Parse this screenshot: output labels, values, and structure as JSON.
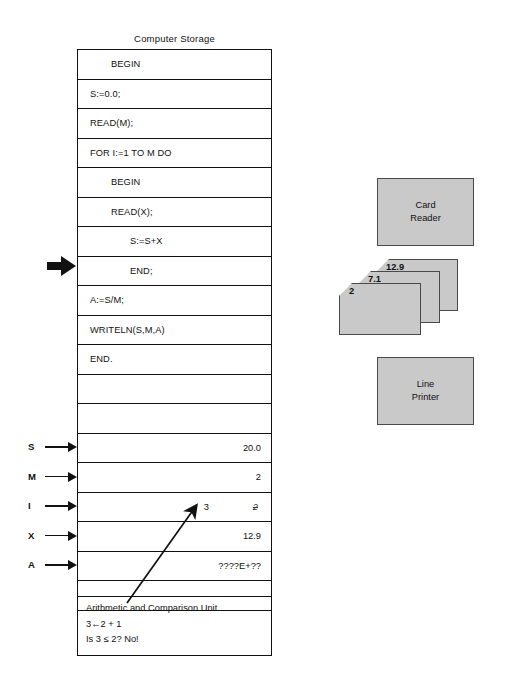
{
  "storage": {
    "title": "Computer Storage",
    "rows": [
      {
        "code": "BEGIN",
        "indent": 1,
        "value": ""
      },
      {
        "code": "S:=0.0;",
        "indent": 0,
        "value": ""
      },
      {
        "code": "READ(M);",
        "indent": 0,
        "value": ""
      },
      {
        "code": "FOR I:=1 TO M DO",
        "indent": 0,
        "value": ""
      },
      {
        "code": "BEGIN",
        "indent": 1,
        "value": ""
      },
      {
        "code": "READ(X);",
        "indent": 1,
        "value": ""
      },
      {
        "code": "S:=S+X",
        "indent": 2,
        "value": ""
      },
      {
        "code": "END;",
        "indent": 2,
        "value": ""
      },
      {
        "code": "A:=S/M;",
        "indent": 0,
        "value": ""
      },
      {
        "code": "WRITELN(S,M,A)",
        "indent": 0,
        "value": ""
      },
      {
        "code": "END.",
        "indent": 0,
        "value": ""
      },
      {
        "code": "",
        "indent": 0,
        "value": ""
      },
      {
        "code": "",
        "indent": 0,
        "value": ""
      },
      {
        "code": "",
        "indent": 0,
        "value": "20.0"
      },
      {
        "code": "",
        "indent": 0,
        "value": "2"
      },
      {
        "code": "",
        "indent": 0,
        "value": ""
      },
      {
        "code": "",
        "indent": 0,
        "value": "12.9"
      },
      {
        "code": "",
        "indent": 0,
        "value": "????E+??"
      },
      {
        "code": "",
        "indent": 0,
        "value": ""
      }
    ],
    "i_row": {
      "new_value": "3",
      "old_value": "2"
    }
  },
  "variables": [
    {
      "name": "S",
      "value": "20.0"
    },
    {
      "name": "M",
      "value": "2"
    },
    {
      "name": "I",
      "value": "3"
    },
    {
      "name": "X",
      "value": "12.9"
    },
    {
      "name": "A",
      "value": "????E+??"
    }
  ],
  "arithmetic_unit": {
    "title": "Arithmetic and Comparison Unit",
    "line1": "3←2 + 1",
    "line2": "Is 3 ≤ 2?  No!"
  },
  "devices": {
    "card_reader": {
      "line1": "Card",
      "line2": "Reader"
    },
    "line_printer": {
      "line1": "Line",
      "line2": "Printer"
    }
  },
  "cards": [
    {
      "value": "12.9"
    },
    {
      "value": "7.1"
    },
    {
      "value": "2"
    }
  ],
  "colors": {
    "device_fill": "#c9c9c9",
    "device_border": "#4a4a4a",
    "line": "#111111",
    "background": "#ffffff"
  }
}
